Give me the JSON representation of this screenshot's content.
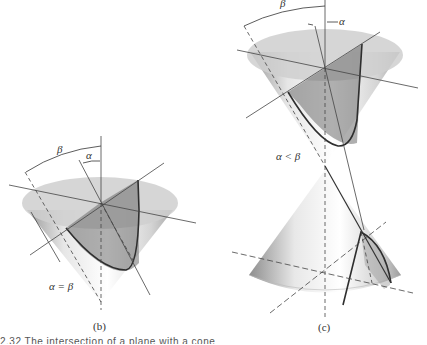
{
  "figure": {
    "panels": [
      {
        "id": "b",
        "label": "(b)",
        "angle_outer": "β",
        "angle_inner": "α",
        "relation": "α = β",
        "section": "parabola"
      },
      {
        "id": "c",
        "label": "(c)",
        "angle_outer": "β",
        "angle_inner": "α",
        "relation": "α < β",
        "section": "hyperbola"
      }
    ],
    "caption_fragment": "2.32   The intersection of a plane with a cone"
  },
  "colors": {
    "line": "#3a3a3a",
    "cone_light": "#f2f2f2",
    "cone_dark": "#bdbdbd",
    "ellipse": "#d3d3d3",
    "plane": "#7a7a7a"
  }
}
